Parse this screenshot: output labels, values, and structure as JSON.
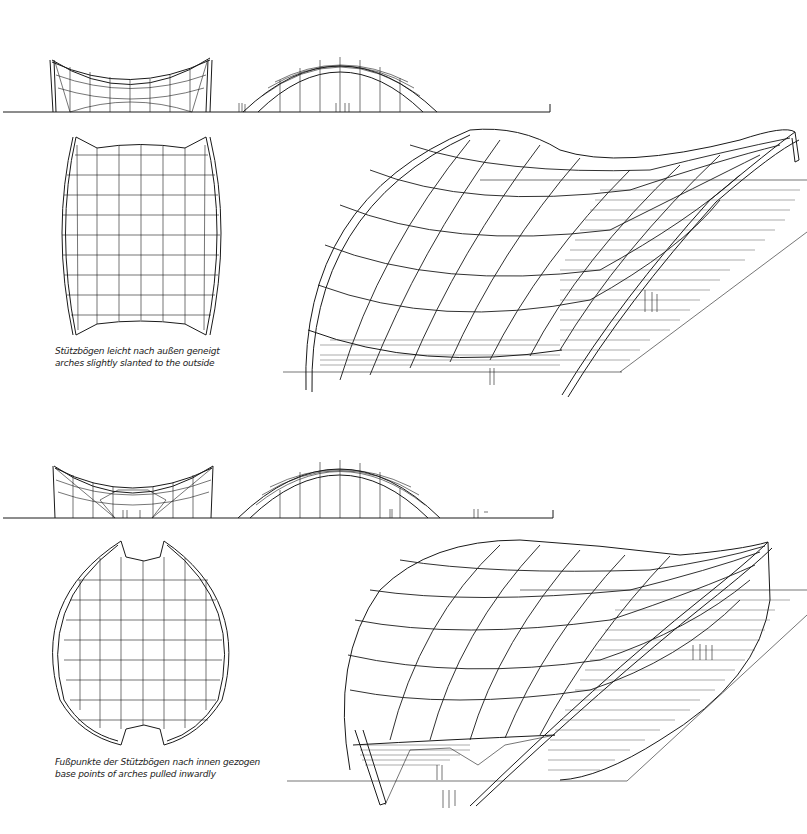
{
  "panels": [
    {
      "id": "variant-1",
      "caption_de": "Stützbögen leicht nach außen geneigt",
      "caption_en": "arches slightly slanted to the outside",
      "views": [
        "side-elevation",
        "front-elevation",
        "plan",
        "perspective"
      ]
    },
    {
      "id": "variant-2",
      "caption_de": "Fußpunkte der Stützbögen nach innen gezogen",
      "caption_en": "base points of arches pulled inwardly",
      "views": [
        "side-elevation",
        "front-elevation",
        "plan",
        "perspective"
      ]
    }
  ],
  "colors": {
    "line": "#1a1a1a",
    "background": "#ffffff"
  }
}
